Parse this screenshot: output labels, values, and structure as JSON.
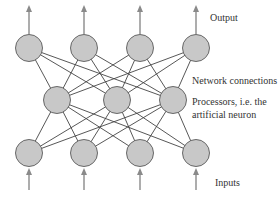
{
  "diagram": {
    "type": "neural-network",
    "labels": {
      "output": "Output",
      "connections": "Network connections",
      "processors_line1": "Processors, i.e. the",
      "processors_line2": "artificial neuron",
      "inputs": "Inputs"
    },
    "layers": {
      "output_layer_nodes": 4,
      "hidden_layer_nodes": 3,
      "input_layer_nodes": 4
    },
    "colors": {
      "node_fill": "#c8c8c8",
      "node_stroke": "#5a5a5a",
      "edge": "#444444",
      "arrow": "#8a8a8a",
      "text": "#333333"
    }
  }
}
